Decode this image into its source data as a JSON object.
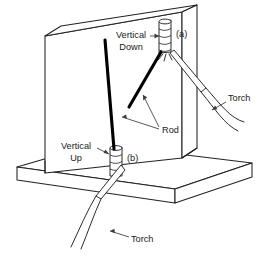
{
  "figure": {
    "background_color": "#ffffff",
    "line_color": "#222222",
    "rod_color": "#000000",
    "text_color": "#1a1a1a"
  },
  "labels": {
    "vertical_down_line1": "Vertical",
    "vertical_down_line2": "Down",
    "vertical_up_line1": "Vertical",
    "vertical_up_line2": "Up",
    "callout_a": "(a)",
    "callout_b": "(b)",
    "rod": "Rod",
    "torch_upper": "Torch",
    "torch_lower": "Torch"
  },
  "parts": [
    {
      "name": "vertical-plate",
      "label": ""
    },
    {
      "name": "base-plate",
      "label": ""
    },
    {
      "name": "weld-bead-a",
      "label": "(a)"
    },
    {
      "name": "weld-bead-b",
      "label": "(b)"
    },
    {
      "name": "filler-rod-a",
      "label": "Rod"
    },
    {
      "name": "filler-rod-b",
      "label": "Rod"
    },
    {
      "name": "torch-a",
      "label": "Torch"
    },
    {
      "name": "torch-b",
      "label": "Torch"
    }
  ]
}
